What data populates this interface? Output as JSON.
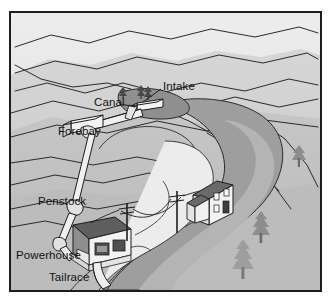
{
  "diagram": {
    "type": "micro-hydro-system-illustration",
    "style": "grayscale-line-illustration",
    "frame": {
      "border_color": "#1d1d1d",
      "background": "#c9c9c9"
    },
    "labels": [
      {
        "id": "intake",
        "text": "Intake",
        "x": 152,
        "y": 73,
        "leader": true
      },
      {
        "id": "canal",
        "text": "Canal",
        "x": 87,
        "y": 89,
        "leader": true
      },
      {
        "id": "forebay",
        "text": "Forebay",
        "x": 51,
        "y": 118,
        "leader": false
      },
      {
        "id": "penstock",
        "text": "Penstock",
        "x": 31,
        "y": 188,
        "leader": false
      },
      {
        "id": "powerhouse",
        "text": "Powerhouse",
        "x": 11,
        "y": 242,
        "leader": false
      },
      {
        "id": "tailrace",
        "text": "Tailrace",
        "x": 42,
        "y": 264,
        "leader": false
      }
    ],
    "flow_sequence": [
      "Intake",
      "Canal",
      "Forebay",
      "Penstock",
      "Powerhouse",
      "Tailrace"
    ],
    "elements": {
      "river": "winding river running from upper-right to lower-left",
      "terrain": "layered hillside contour lines",
      "house": "residential house on mid-right hillside",
      "powerhouse_building": "generator building at lower left",
      "utility_poles": 2,
      "trees": 6
    },
    "colors": {
      "sky": "#e6e6e6",
      "hill_far": "#dcdcdc",
      "hill_mid": "#cfcfcf",
      "hill_near": "#c3c3c3",
      "ground": "#bfbfbf",
      "river_bank": "#9a9a9a",
      "river_water": "#efefef",
      "roof_dark": "#5e5e5e",
      "wall_white": "#f2f2f2",
      "pipe": "#ededed",
      "outline": "#1d1d1d",
      "tree_dark": "#565656",
      "tree_light": "#9e9e9e",
      "label_text": "#111111"
    }
  }
}
